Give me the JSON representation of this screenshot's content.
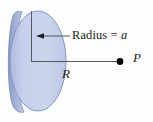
{
  "figure": {
    "type": "physics-diagram",
    "background_color": "#fefefe",
    "disk": {
      "name": "charged-disk",
      "fill_color": "#c2cdea",
      "edge_color": "#8b9dc8",
      "rim_color": "#9aaad3",
      "highlight_color": "#dde3f4",
      "center_x": 36,
      "center_y": 61,
      "radius_x": 30,
      "radius_y": 51
    },
    "annotations": {
      "radius": {
        "text_prefix": "Radius = ",
        "variable": "a",
        "full_text": "Radius = a"
      },
      "distance": {
        "variable": "R"
      },
      "point": {
        "variable": "P"
      }
    },
    "leader_line_color": "#58585b",
    "axis_line_color": "#58585b",
    "point_marker_color": "#000000"
  }
}
